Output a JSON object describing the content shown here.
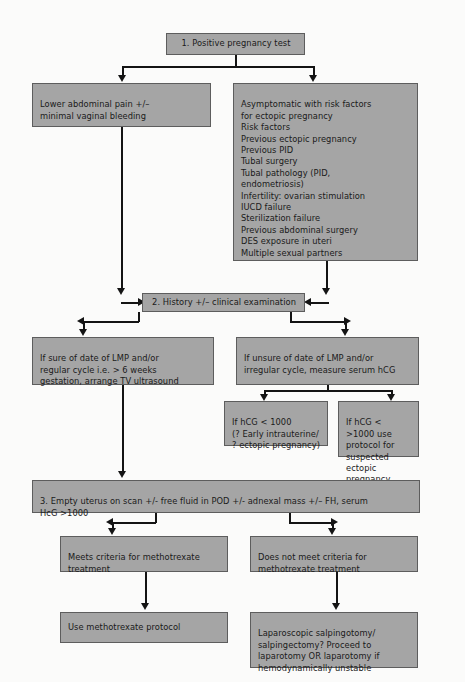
{
  "diagram": {
    "colors": {
      "box_fill": "#a5a5a5",
      "box_border": "#5d5d5d",
      "connector": "#141414",
      "background": "#fbfbfa"
    },
    "nodes": {
      "positive_pregnancy_test": "1. Positive pregnancy test",
      "lower_abdominal_pain": "Lower abdominal pain +/–\nminimal vaginal bleeding",
      "risk_factors": "Asymptomatic with risk factors\nfor ectopic pregnancy\nRisk factors\nPrevious ectopic pregnancy\nPrevious PID\nTubal surgery\nTubal pathology (PID,\nendometriosis)\nInfertility: ovarian stimulation\nIUCD failure\nSterilization failure\nPrevious abdominal surgery\nDES exposure in uteri\nMultiple sexual partners",
      "history_clinical_exam": "2. History +/– clinical examination",
      "sure_of_date": "If sure of date of LMP and/or\nregular cycle i.e. > 6 weeks\ngestation, arrange TV ultrasound",
      "unsure_of_date": "If unsure of date of LMP and/or\nirregular cycle, measure serum hCG",
      "hcg_low": "If hCG < 1000\n(? Early intrauterine/\n? ectopic pregnancy)",
      "hcg_high": "If hCG < >1000 use\nprotocol for\nsuspected ectopic\npregnancy",
      "empty_uterus": "3. Empty uterus on scan +/- free fluid in POD +/- adnexal mass +/– FH, serum\nHcG >1000",
      "meets_criteria": "Meets criteria for methotrexate\ntreatment",
      "does_not_meet_criteria": "Does not meet criteria for\nmethotrexate treatment",
      "use_methotrexate": "Use methotrexate protocol",
      "surgical_management": "Laparoscopic salpingotomy/\nsalpingectomy? Proceed to\nlaparotomy OR laparotomy if\nhemodynamically unstable"
    }
  }
}
